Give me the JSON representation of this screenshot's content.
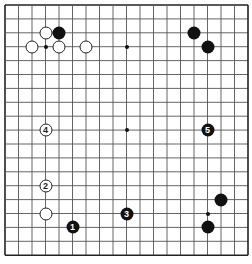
{
  "board": {
    "size": 19,
    "origin_x": 5,
    "origin_y": 5,
    "step_x": 13.5,
    "step_y": 13.9,
    "line_color": "#555555",
    "border_color": "#222222",
    "star_points": [
      [
        3,
        3
      ],
      [
        9,
        3
      ],
      [
        15,
        3
      ],
      [
        3,
        9
      ],
      [
        9,
        9
      ],
      [
        15,
        9
      ],
      [
        3,
        15
      ],
      [
        9,
        15
      ],
      [
        15,
        15
      ]
    ],
    "stones": [
      {
        "color": "white",
        "col": 3,
        "row": 2,
        "label": ""
      },
      {
        "color": "black",
        "col": 4,
        "row": 2,
        "label": ""
      },
      {
        "color": "white",
        "col": 2,
        "row": 3,
        "label": ""
      },
      {
        "color": "white",
        "col": 4,
        "row": 3,
        "label": ""
      },
      {
        "color": "white",
        "col": 6,
        "row": 3,
        "label": ""
      },
      {
        "color": "black",
        "col": 14,
        "row": 2,
        "label": ""
      },
      {
        "color": "black",
        "col": 15,
        "row": 3,
        "label": ""
      },
      {
        "color": "white",
        "col": 3,
        "row": 9,
        "label": "4"
      },
      {
        "color": "white",
        "col": 3,
        "row": 13,
        "label": "2"
      },
      {
        "color": "white",
        "col": 3,
        "row": 15,
        "label": ""
      },
      {
        "color": "black",
        "col": 5,
        "row": 16,
        "label": "1"
      },
      {
        "color": "black",
        "col": 9,
        "row": 15,
        "label": "3"
      },
      {
        "color": "black",
        "col": 15,
        "row": 9,
        "label": "5"
      },
      {
        "color": "black",
        "col": 16,
        "row": 14,
        "label": ""
      },
      {
        "color": "black",
        "col": 15,
        "row": 16,
        "label": ""
      }
    ]
  }
}
